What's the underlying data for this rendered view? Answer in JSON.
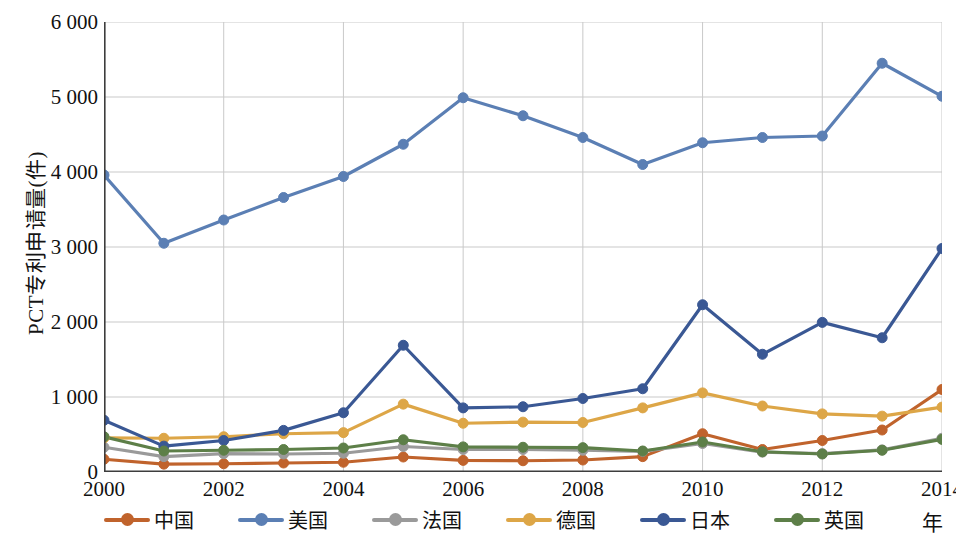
{
  "chart_data": {
    "type": "line",
    "title": "",
    "xlabel": "年",
    "ylabel": "PCT专利申请量(件)",
    "xlim": [
      2000,
      2014
    ],
    "ylim": [
      0,
      6000
    ],
    "grid": true,
    "legend_position": "bottom",
    "x": [
      2000,
      2001,
      2002,
      2003,
      2004,
      2005,
      2006,
      2007,
      2008,
      2009,
      2010,
      2011,
      2012,
      2013,
      2014
    ],
    "x_tick_labels": [
      "2000",
      "2002",
      "2004",
      "2006",
      "2008",
      "2010",
      "2012",
      "2014"
    ],
    "x_ticks": [
      2000,
      2002,
      2004,
      2006,
      2008,
      2010,
      2012,
      2014
    ],
    "y_ticks": [
      0,
      1000,
      2000,
      3000,
      4000,
      5000,
      6000
    ],
    "y_tick_labels": [
      "0",
      "1 000",
      "2 000",
      "3 000",
      "4 000",
      "5 000",
      "6 000"
    ],
    "series": [
      {
        "name": "中国",
        "color": "#c0632c",
        "values": [
          170,
          105,
          110,
          120,
          130,
          200,
          155,
          150,
          160,
          205,
          510,
          300,
          420,
          560,
          1100
        ]
      },
      {
        "name": "美国",
        "color": "#5b7fb4",
        "values": [
          3960,
          3050,
          3360,
          3660,
          3940,
          4370,
          4990,
          4750,
          4460,
          4100,
          4390,
          4460,
          4480,
          5450,
          5010
        ]
      },
      {
        "name": "法国",
        "color": "#9a9a9a",
        "values": [
          330,
          205,
          245,
          240,
          250,
          340,
          300,
          300,
          290,
          275,
          380,
          265,
          245,
          295,
          450
        ]
      },
      {
        "name": "德国",
        "color": "#dda647",
        "values": [
          455,
          450,
          470,
          510,
          525,
          905,
          650,
          665,
          660,
          855,
          1055,
          880,
          775,
          745,
          865
        ]
      },
      {
        "name": "日本",
        "color": "#3a5894",
        "values": [
          690,
          345,
          420,
          555,
          790,
          1690,
          855,
          870,
          980,
          1110,
          2230,
          1570,
          1995,
          1790,
          2980
        ]
      },
      {
        "name": "英国",
        "color": "#5d7f48",
        "values": [
          470,
          280,
          290,
          300,
          320,
          430,
          335,
          330,
          325,
          280,
          400,
          270,
          240,
          290,
          435
        ]
      }
    ]
  },
  "axes": {
    "y_title": "PCT专利申请量(件)",
    "x_title": "年"
  },
  "legend": {
    "items": [
      {
        "label": "中国",
        "color": "#c0632c"
      },
      {
        "label": "美国",
        "color": "#5b7fb4"
      },
      {
        "label": "法国",
        "color": "#9a9a9a"
      },
      {
        "label": "德国",
        "color": "#dda647"
      },
      {
        "label": "日本",
        "color": "#3a5894"
      },
      {
        "label": "英国",
        "color": "#5d7f48"
      }
    ]
  },
  "style": {
    "grid_color": "#c9c9c9",
    "axis_color": "#3d3d3d",
    "background": "#ffffff"
  }
}
